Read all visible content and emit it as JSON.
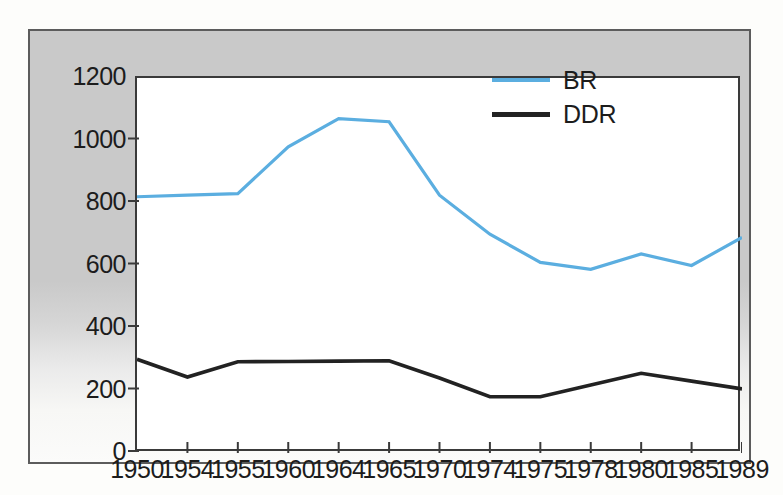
{
  "chart_data": {
    "type": "line",
    "title": "",
    "subtitle": "",
    "xlabel": "",
    "ylabel": "",
    "categories": [
      "1950",
      "1954",
      "1955",
      "1960",
      "1964",
      "1965",
      "1970",
      "1974",
      "1975",
      "1978",
      "1980",
      "1985",
      "1989"
    ],
    "series": [
      {
        "name": "BR",
        "color": "#5BAEE0",
        "values": [
          820,
          825,
          830,
          980,
          1070,
          1060,
          825,
          700,
          610,
          588,
          637,
          600,
          690
        ]
      },
      {
        "name": "DDR",
        "color": "#222222",
        "values": [
          300,
          243,
          292,
          293,
          294,
          295,
          240,
          180,
          180,
          218,
          255,
          230,
          205
        ]
      }
    ],
    "ylim": [
      0,
      1200
    ],
    "y_ticks": [
      "0",
      "200",
      "400",
      "600",
      "800",
      "1000",
      "1200"
    ],
    "y_tick_values": [
      0,
      200,
      400,
      600,
      800,
      1000,
      1200
    ],
    "grid": false,
    "legend_position": "top-right"
  },
  "legend": {
    "entries": [
      {
        "label": "BR",
        "color": "#5BAEE0"
      },
      {
        "label": "DDR",
        "color": "#222222"
      }
    ]
  },
  "colors": {
    "series_br": "#5BAEE0",
    "series_ddr": "#222222",
    "panel_background": "#c9c9c9",
    "plot_background": "#ffffff",
    "axis": "#3a3a3a",
    "frame": "#5c5c5c",
    "text": "#1c1c1c"
  }
}
